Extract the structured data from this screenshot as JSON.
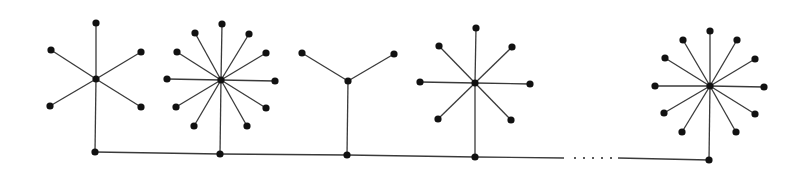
{
  "diagram": {
    "type": "graph",
    "colors": {
      "edge": "#3a3a3a",
      "node": "#111111",
      "background": "#ffffff"
    },
    "spine": {
      "nodes": [
        [
          95,
          152
        ],
        [
          220,
          154
        ],
        [
          347,
          155
        ],
        [
          475,
          157
        ],
        [
          709,
          160
        ]
      ],
      "segments": [
        [
          [
            95,
            152
          ],
          [
            220,
            154
          ]
        ],
        [
          [
            220,
            154
          ],
          [
            347,
            155
          ]
        ],
        [
          [
            347,
            155
          ],
          [
            475,
            157
          ]
        ],
        [
          [
            475,
            157
          ],
          [
            564,
            158
          ]
        ],
        [
          [
            618,
            158
          ],
          [
            709,
            160
          ]
        ]
      ],
      "ellipsis": {
        "dots": [
          [
            575,
            158
          ],
          [
            584,
            158
          ],
          [
            593,
            158
          ],
          [
            602,
            158
          ],
          [
            611,
            158
          ]
        ]
      }
    },
    "stars": [
      {
        "id": "star-1",
        "center": [
          96,
          79
        ],
        "spine_node": [
          95,
          152
        ],
        "leaves": [
          [
            96,
            23
          ],
          [
            51,
            50
          ],
          [
            141,
            52
          ],
          [
            50,
            106
          ],
          [
            141,
            107
          ]
        ]
      },
      {
        "id": "star-2",
        "center": [
          221,
          80
        ],
        "spine_node": [
          220,
          154
        ],
        "leaves": [
          [
            222,
            24
          ],
          [
            195,
            33
          ],
          [
            249,
            34
          ],
          [
            177,
            52
          ],
          [
            266,
            53
          ],
          [
            167,
            79
          ],
          [
            275,
            81
          ],
          [
            176,
            107
          ],
          [
            266,
            108
          ],
          [
            194,
            126
          ],
          [
            247,
            126
          ]
        ]
      },
      {
        "id": "star-3",
        "center": [
          348,
          81
        ],
        "spine_node": [
          347,
          155
        ],
        "leaves": [
          [
            302,
            53
          ],
          [
            394,
            54
          ]
        ]
      },
      {
        "id": "star-4",
        "center": [
          475,
          83
        ],
        "spine_node": [
          475,
          157
        ],
        "leaves": [
          [
            476,
            28
          ],
          [
            439,
            46
          ],
          [
            512,
            47
          ],
          [
            420,
            82
          ],
          [
            530,
            84
          ],
          [
            438,
            119
          ],
          [
            511,
            120
          ]
        ]
      },
      {
        "id": "star-5",
        "center": [
          710,
          86
        ],
        "spine_node": [
          709,
          160
        ],
        "leaves": [
          [
            710,
            31
          ],
          [
            683,
            40
          ],
          [
            737,
            40
          ],
          [
            665,
            58
          ],
          [
            755,
            59
          ],
          [
            655,
            86
          ],
          [
            764,
            87
          ],
          [
            664,
            113
          ],
          [
            755,
            114
          ],
          [
            682,
            132
          ],
          [
            736,
            132
          ]
        ]
      }
    ]
  }
}
